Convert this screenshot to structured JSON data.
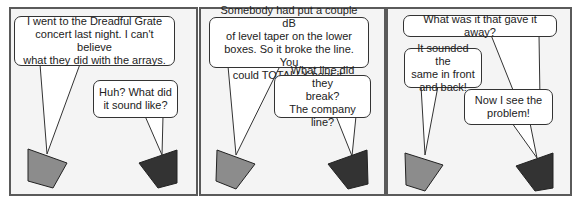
{
  "comic": {
    "colors": {
      "panel_border": "#5a5a5a",
      "panel_background": "#f4f4f4",
      "bubble_fill": "#ffffff",
      "bubble_stroke": "#333333",
      "speaker_light": "#8c8c8c",
      "speaker_dark": "#333333"
    },
    "panels": [
      {
        "bubbles": [
          {
            "speaker": "light",
            "text": "I went to the Dreadful Grate\nconcert last night. I can't believe\nwhat they did with the arrays."
          },
          {
            "speaker": "dark",
            "text": "Huh? What did\nit sound like?"
          }
        ]
      },
      {
        "bubbles": [
          {
            "speaker": "light",
            "text": "Somebody had put a couple dB\nof level taper on the lower\nboxes. So it broke the line. You\ncould TOTALLY hear it."
          },
          {
            "speaker": "dark",
            "text": "What line did they\nbreak?\nThe company line?"
          }
        ]
      },
      {
        "bubbles": [
          {
            "speaker": "dark",
            "text": "What was it that gave it away?"
          },
          {
            "speaker": "light",
            "text": "It sounded the\nsame in front\nand back!"
          },
          {
            "speaker": "dark",
            "text": "Now I see the\nproblem!"
          }
        ]
      }
    ]
  }
}
